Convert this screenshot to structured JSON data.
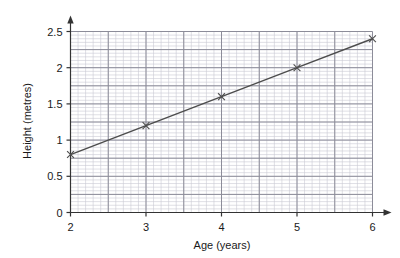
{
  "chart_data": {
    "type": "line",
    "title": "",
    "xlabel": "Age (years)",
    "ylabel": "Height (metres)",
    "xlim": [
      2,
      6
    ],
    "ylim": [
      0,
      2.5
    ],
    "grid": true,
    "legend": "none",
    "x": [
      2,
      3,
      4,
      5,
      6
    ],
    "series": [
      {
        "name": "Height",
        "values": [
          0.8,
          1.2,
          1.6,
          2.0,
          2.4
        ],
        "color": "#4d4d4d",
        "marker": "cross"
      }
    ],
    "x_ticks": [
      "2",
      "3",
      "4",
      "5",
      "6"
    ],
    "x_tick_values": [
      2,
      3,
      4,
      5,
      6
    ],
    "y_ticks": [
      "0",
      "0.5",
      "1",
      "1.5",
      "2",
      "2.5"
    ],
    "y_tick_values": [
      0,
      0.5,
      1,
      1.5,
      2,
      2.5
    ],
    "x_major_step": 0.5,
    "x_minor_step": 0.1,
    "y_major_step": 0.25,
    "y_minor_step": 0.05,
    "axis_arrows": [
      "x-right",
      "y-up"
    ],
    "colors": {
      "axis": "#333333",
      "major_grid": "#8c8c99",
      "minor_grid": "#c9c9d4",
      "line": "#4d4d4d",
      "text": "#1a1a1a",
      "background": "#ffffff"
    }
  },
  "labels": {
    "x_axis_title": "Age (years)",
    "y_axis_title": "Height (metres)"
  }
}
